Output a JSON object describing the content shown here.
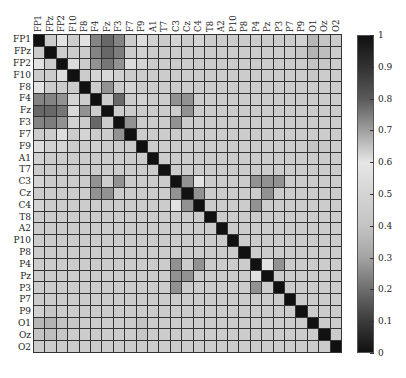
{
  "chart_data": {
    "type": "heatmap",
    "title": "",
    "xlabel": "",
    "ylabel": "",
    "labels": [
      "FP1",
      "FPz",
      "FP2",
      "F10",
      "F8",
      "F4",
      "Fz",
      "F3",
      "F7",
      "F9",
      "A1",
      "T7",
      "C3",
      "Cz",
      "C4",
      "T8",
      "A2",
      "P10",
      "P8",
      "P4",
      "Pz",
      "P3",
      "P7",
      "P9",
      "O1",
      "Oz",
      "O2"
    ],
    "x_tick_labels": [
      "FP1",
      "FPz",
      "FP2",
      "F10",
      "F8",
      "F4",
      "Fz",
      "F3",
      "F7",
      "F9",
      "A1",
      "T7",
      "C3",
      "Cz",
      "C4",
      "T8",
      "A2",
      "P10",
      "P8",
      "P4",
      "Pz",
      "P3",
      "P7",
      "P9",
      "O1",
      "Oz",
      "O2"
    ],
    "y_tick_labels": [
      "FP1",
      "FPz",
      "FP2",
      "F10",
      "F8",
      "F4",
      "Fz",
      "F3",
      "F7",
      "F9",
      "A1",
      "T7",
      "C3",
      "Cz",
      "C4",
      "T8",
      "A2",
      "P10",
      "P8",
      "P4",
      "Pz",
      "P3",
      "P7",
      "P9",
      "O1",
      "Oz",
      "O2"
    ],
    "colorbar": {
      "min": 0,
      "max": 1,
      "ticks": [
        "0",
        "0.1",
        "0.2",
        "0.3",
        "0.4",
        "0.5",
        "0.6",
        "0.7",
        "0.8",
        "0.9",
        "1"
      ],
      "stops": [
        {
          "v": 0.0,
          "color": "#111111"
        },
        {
          "v": 0.1,
          "color": "#3c3c3c"
        },
        {
          "v": 0.2,
          "color": "#6e6e6e"
        },
        {
          "v": 0.3,
          "color": "#a4a4a4"
        },
        {
          "v": 0.4,
          "color": "#c4c4c4"
        },
        {
          "v": 0.5,
          "color": "#d4d4d4"
        },
        {
          "v": 0.6,
          "color": "#e6e6e6"
        },
        {
          "v": 0.7,
          "color": "#a0a0a0"
        },
        {
          "v": 0.8,
          "color": "#5a5a5a"
        },
        {
          "v": 0.9,
          "color": "#333333"
        },
        {
          "v": 1.0,
          "color": "#111111"
        }
      ]
    },
    "grid": true,
    "legend_position": "right",
    "values": [
      [
        1.0,
        0.45,
        0.58,
        0.45,
        0.58,
        0.74,
        0.78,
        0.74,
        0.45,
        0.55,
        0.48,
        0.45,
        0.5,
        0.45,
        0.5,
        0.45,
        0.45,
        0.45,
        0.45,
        0.45,
        0.45,
        0.45,
        0.45,
        0.48,
        0.36,
        0.4,
        0.45
      ],
      [
        0.45,
        1.0,
        0.45,
        0.45,
        0.45,
        0.74,
        0.78,
        0.75,
        0.45,
        0.48,
        0.45,
        0.45,
        0.45,
        0.45,
        0.45,
        0.45,
        0.45,
        0.45,
        0.45,
        0.45,
        0.45,
        0.45,
        0.45,
        0.42,
        0.35,
        0.38,
        0.45
      ],
      [
        0.58,
        0.45,
        1.0,
        0.55,
        0.45,
        0.72,
        0.76,
        0.72,
        0.55,
        0.5,
        0.45,
        0.45,
        0.45,
        0.45,
        0.45,
        0.45,
        0.45,
        0.45,
        0.45,
        0.45,
        0.45,
        0.45,
        0.45,
        0.45,
        0.4,
        0.42,
        0.45
      ],
      [
        0.45,
        0.45,
        0.55,
        1.0,
        0.45,
        0.5,
        0.62,
        0.48,
        0.45,
        0.45,
        0.45,
        0.45,
        0.45,
        0.45,
        0.45,
        0.45,
        0.45,
        0.45,
        0.45,
        0.45,
        0.45,
        0.45,
        0.45,
        0.45,
        0.42,
        0.45,
        0.45
      ],
      [
        0.58,
        0.45,
        0.45,
        0.45,
        1.0,
        0.45,
        0.72,
        0.45,
        0.5,
        0.45,
        0.45,
        0.45,
        0.45,
        0.45,
        0.45,
        0.45,
        0.45,
        0.45,
        0.45,
        0.45,
        0.45,
        0.45,
        0.45,
        0.45,
        0.45,
        0.45,
        0.45
      ],
      [
        0.74,
        0.74,
        0.72,
        0.5,
        0.45,
        1.0,
        0.45,
        0.78,
        0.45,
        0.48,
        0.45,
        0.45,
        0.72,
        0.72,
        0.45,
        0.45,
        0.45,
        0.45,
        0.45,
        0.45,
        0.45,
        0.45,
        0.45,
        0.45,
        0.45,
        0.45,
        0.45
      ],
      [
        0.78,
        0.78,
        0.76,
        0.62,
        0.72,
        0.45,
        1.0,
        0.45,
        0.45,
        0.45,
        0.45,
        0.45,
        0.45,
        0.72,
        0.45,
        0.45,
        0.45,
        0.45,
        0.45,
        0.45,
        0.45,
        0.45,
        0.45,
        0.45,
        0.45,
        0.45,
        0.45
      ],
      [
        0.74,
        0.75,
        0.72,
        0.48,
        0.45,
        0.78,
        0.45,
        1.0,
        0.72,
        0.45,
        0.45,
        0.45,
        0.72,
        0.45,
        0.45,
        0.45,
        0.45,
        0.45,
        0.45,
        0.45,
        0.45,
        0.45,
        0.45,
        0.45,
        0.45,
        0.45,
        0.45
      ],
      [
        0.45,
        0.45,
        0.55,
        0.45,
        0.5,
        0.45,
        0.45,
        0.72,
        1.0,
        0.45,
        0.45,
        0.45,
        0.45,
        0.45,
        0.45,
        0.45,
        0.45,
        0.45,
        0.45,
        0.45,
        0.45,
        0.45,
        0.45,
        0.45,
        0.45,
        0.45,
        0.45
      ],
      [
        0.55,
        0.48,
        0.5,
        0.45,
        0.45,
        0.48,
        0.45,
        0.45,
        0.45,
        1.0,
        0.45,
        0.45,
        0.45,
        0.45,
        0.45,
        0.45,
        0.45,
        0.45,
        0.45,
        0.45,
        0.45,
        0.45,
        0.45,
        0.45,
        0.4,
        0.42,
        0.45
      ],
      [
        0.48,
        0.45,
        0.45,
        0.45,
        0.45,
        0.45,
        0.45,
        0.45,
        0.45,
        0.45,
        1.0,
        0.45,
        0.45,
        0.45,
        0.45,
        0.45,
        0.45,
        0.45,
        0.45,
        0.45,
        0.45,
        0.45,
        0.45,
        0.45,
        0.45,
        0.45,
        0.45
      ],
      [
        0.45,
        0.45,
        0.45,
        0.45,
        0.45,
        0.45,
        0.45,
        0.45,
        0.45,
        0.45,
        0.45,
        1.0,
        0.45,
        0.45,
        0.45,
        0.45,
        0.45,
        0.45,
        0.45,
        0.45,
        0.45,
        0.45,
        0.45,
        0.45,
        0.45,
        0.45,
        0.45
      ],
      [
        0.5,
        0.45,
        0.45,
        0.45,
        0.45,
        0.72,
        0.45,
        0.72,
        0.45,
        0.45,
        0.45,
        0.45,
        1.0,
        0.72,
        0.58,
        0.45,
        0.45,
        0.45,
        0.45,
        0.72,
        0.72,
        0.72,
        0.45,
        0.45,
        0.45,
        0.45,
        0.45
      ],
      [
        0.45,
        0.45,
        0.45,
        0.45,
        0.45,
        0.72,
        0.72,
        0.45,
        0.45,
        0.45,
        0.45,
        0.45,
        0.72,
        1.0,
        0.72,
        0.45,
        0.45,
        0.45,
        0.45,
        0.45,
        0.72,
        0.45,
        0.45,
        0.45,
        0.45,
        0.45,
        0.45
      ],
      [
        0.5,
        0.45,
        0.45,
        0.45,
        0.45,
        0.45,
        0.45,
        0.45,
        0.45,
        0.45,
        0.45,
        0.45,
        0.58,
        0.72,
        1.0,
        0.45,
        0.45,
        0.45,
        0.45,
        0.72,
        0.45,
        0.45,
        0.45,
        0.45,
        0.45,
        0.45,
        0.45
      ],
      [
        0.45,
        0.45,
        0.45,
        0.45,
        0.45,
        0.45,
        0.45,
        0.45,
        0.45,
        0.45,
        0.45,
        0.45,
        0.45,
        0.45,
        0.45,
        1.0,
        0.45,
        0.45,
        0.45,
        0.45,
        0.45,
        0.45,
        0.45,
        0.45,
        0.45,
        0.45,
        0.45
      ],
      [
        0.45,
        0.45,
        0.45,
        0.45,
        0.45,
        0.45,
        0.45,
        0.45,
        0.45,
        0.45,
        0.45,
        0.45,
        0.45,
        0.45,
        0.45,
        0.45,
        1.0,
        0.45,
        0.45,
        0.45,
        0.45,
        0.45,
        0.45,
        0.45,
        0.45,
        0.45,
        0.45
      ],
      [
        0.45,
        0.45,
        0.45,
        0.45,
        0.45,
        0.45,
        0.45,
        0.45,
        0.45,
        0.45,
        0.45,
        0.45,
        0.45,
        0.45,
        0.45,
        0.45,
        0.45,
        1.0,
        0.45,
        0.45,
        0.45,
        0.45,
        0.45,
        0.45,
        0.45,
        0.45,
        0.45
      ],
      [
        0.45,
        0.45,
        0.45,
        0.45,
        0.45,
        0.45,
        0.45,
        0.45,
        0.45,
        0.45,
        0.45,
        0.45,
        0.45,
        0.45,
        0.45,
        0.45,
        0.45,
        0.45,
        1.0,
        0.45,
        0.45,
        0.45,
        0.45,
        0.45,
        0.45,
        0.45,
        0.45
      ],
      [
        0.45,
        0.45,
        0.45,
        0.45,
        0.45,
        0.45,
        0.45,
        0.45,
        0.45,
        0.45,
        0.45,
        0.45,
        0.72,
        0.45,
        0.72,
        0.45,
        0.45,
        0.45,
        0.45,
        1.0,
        0.58,
        0.72,
        0.45,
        0.45,
        0.45,
        0.45,
        0.45
      ],
      [
        0.45,
        0.45,
        0.45,
        0.45,
        0.45,
        0.45,
        0.45,
        0.45,
        0.45,
        0.45,
        0.45,
        0.45,
        0.72,
        0.72,
        0.45,
        0.45,
        0.45,
        0.45,
        0.45,
        0.58,
        1.0,
        0.45,
        0.45,
        0.45,
        0.45,
        0.45,
        0.45
      ],
      [
        0.45,
        0.45,
        0.45,
        0.45,
        0.45,
        0.45,
        0.45,
        0.45,
        0.45,
        0.45,
        0.45,
        0.45,
        0.72,
        0.45,
        0.45,
        0.45,
        0.45,
        0.45,
        0.45,
        0.72,
        0.45,
        1.0,
        0.45,
        0.45,
        0.45,
        0.45,
        0.45
      ],
      [
        0.45,
        0.45,
        0.45,
        0.45,
        0.45,
        0.45,
        0.45,
        0.45,
        0.45,
        0.45,
        0.45,
        0.45,
        0.45,
        0.45,
        0.45,
        0.45,
        0.45,
        0.45,
        0.45,
        0.45,
        0.45,
        0.45,
        1.0,
        0.45,
        0.45,
        0.45,
        0.45
      ],
      [
        0.48,
        0.42,
        0.45,
        0.45,
        0.45,
        0.45,
        0.45,
        0.45,
        0.45,
        0.45,
        0.45,
        0.45,
        0.45,
        0.45,
        0.45,
        0.45,
        0.45,
        0.45,
        0.45,
        0.45,
        0.45,
        0.45,
        0.45,
        1.0,
        0.45,
        0.45,
        0.45
      ],
      [
        0.36,
        0.35,
        0.4,
        0.42,
        0.45,
        0.45,
        0.45,
        0.45,
        0.45,
        0.4,
        0.45,
        0.45,
        0.45,
        0.45,
        0.45,
        0.45,
        0.45,
        0.45,
        0.45,
        0.45,
        0.45,
        0.45,
        0.45,
        0.45,
        1.0,
        0.45,
        0.45
      ],
      [
        0.4,
        0.38,
        0.42,
        0.45,
        0.45,
        0.45,
        0.45,
        0.45,
        0.45,
        0.42,
        0.45,
        0.45,
        0.45,
        0.45,
        0.45,
        0.45,
        0.45,
        0.45,
        0.45,
        0.45,
        0.45,
        0.45,
        0.45,
        0.45,
        0.45,
        1.0,
        0.45
      ],
      [
        0.45,
        0.45,
        0.45,
        0.45,
        0.45,
        0.45,
        0.45,
        0.45,
        0.45,
        0.45,
        0.45,
        0.45,
        0.45,
        0.45,
        0.45,
        0.45,
        0.45,
        0.45,
        0.45,
        0.45,
        0.45,
        0.45,
        0.45,
        0.45,
        0.45,
        0.45,
        1.0
      ]
    ]
  }
}
